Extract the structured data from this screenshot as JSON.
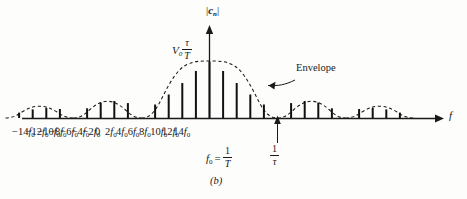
{
  "figure": {
    "caption": "(b)",
    "y_axis_label_symbol": "c",
    "y_axis_label_sub": "n",
    "x_axis_label": "f",
    "peak_label_symbol": "V",
    "peak_label_sub": "0",
    "peak_label_num": "τ",
    "peak_label_den": "T",
    "envelope_label": "Envelope",
    "f0_def_symbol": "f",
    "f0_def_sub": "0",
    "f0_def_equals": "=",
    "f0_def_num": "1",
    "f0_def_den": "T",
    "tau_def_num": "1",
    "tau_def_den": "τ",
    "line_color": "#111111",
    "envelope_color": "#1a1a1a",
    "axis_color": "#1a1a1a",
    "background": "#fdfdfc"
  },
  "x_tick_labels": [
    {
      "text": "−14f",
      "sub": "0",
      "x": 36
    },
    {
      "text": "−12f",
      "sub": "0",
      "x": 77
    },
    {
      "text": "−10f",
      "sub": "0",
      "x": 112
    },
    {
      "text": "−8f",
      "sub": "0",
      "x": 147
    },
    {
      "text": "−6f",
      "sub": "0",
      "x": 181
    },
    {
      "text": "−4f",
      "sub": "0",
      "x": 215
    },
    {
      "text": "−2f",
      "sub": "0",
      "x": 248
    },
    {
      "text": "0",
      "sub": "",
      "x": 285
    },
    {
      "text": "2f",
      "sub": "0",
      "x": 315
    },
    {
      "text": "4f",
      "sub": "0",
      "x": 348
    },
    {
      "text": "6f",
      "sub": "0",
      "x": 383
    },
    {
      "text": "8f",
      "sub": "0",
      "x": 417
    },
    {
      "text": "10f",
      "sub": "0",
      "x": 451
    },
    {
      "text": "12f",
      "sub": "0",
      "x": 486
    },
    {
      "text": "14f",
      "sub": "0",
      "x": 520
    }
  ],
  "chart_data": {
    "type": "line",
    "title": "",
    "subtitle": "(b)",
    "xlabel": "f",
    "ylabel": "|c_n|",
    "envelope_function": "|V0*(tau/T)*sinc(n*f0*tau)|",
    "envelope_nulls_in_f0": [
      -15,
      -10,
      -5,
      5,
      10,
      15
    ],
    "peak_value_label": "V0 tau/T",
    "harmonic_spacing_label": "f0 = 1/T",
    "envelope_null_label": "1/tau",
    "tau_over_T": 0.2,
    "xlim_in_f0": [
      -15.5,
      15.5
    ],
    "ylim": [
      0,
      1.0
    ],
    "grid": false,
    "legend": "none",
    "annotations": [
      {
        "text": "Envelope",
        "points_to_in_f0": 3.4
      },
      {
        "text": "1/tau",
        "points_to_in_f0": 5.0
      }
    ],
    "x_in_f0": [
      -15,
      -14,
      -13,
      -12,
      -11,
      -10,
      -9,
      -8,
      -7,
      -6,
      -5,
      -4,
      -3,
      -2,
      -1,
      0,
      1,
      2,
      3,
      4,
      5,
      6,
      7,
      8,
      9,
      10,
      11,
      12,
      13,
      14,
      15
    ],
    "values": [
      0.0,
      0.0468,
      0.0755,
      0.0624,
      0.0,
      0.0,
      0.0935,
      0.1558,
      0.1401,
      0.0,
      0.0,
      0.2339,
      0.4132,
      0.6057,
      0.8145,
      1.0,
      0.8145,
      0.6057,
      0.4132,
      0.2339,
      0.0,
      0.0,
      0.1401,
      0.1558,
      0.0935,
      0.0,
      0.0,
      0.0624,
      0.0755,
      0.0468,
      0.0
    ]
  }
}
